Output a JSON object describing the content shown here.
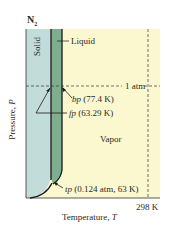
{
  "diagram": {
    "title": "N",
    "title_subscript": "2",
    "type": "phase diagram",
    "axes": {
      "x_label": "Temperature, ",
      "x_symbol": "T",
      "y_label": "Pressure, ",
      "y_symbol": "P",
      "x_tick": "298 K",
      "y_reference": "1 atm"
    },
    "regions": {
      "solid": "Solid",
      "liquid": "Liquid",
      "vapor": "Vapor"
    },
    "annotations": {
      "bp_abbr": "bp",
      "bp_value": " (77.4 K)",
      "fp_abbr": "fp",
      "fp_value": " (63.29 K)",
      "tp_abbr": "tp",
      "tp_value": " (0.124 atm, 63 K)"
    },
    "colors": {
      "solid": "#c2dcda",
      "liquid": "#7fae8f",
      "vapor": "#fbf8cf",
      "line": "#1a1a1a"
    }
  }
}
